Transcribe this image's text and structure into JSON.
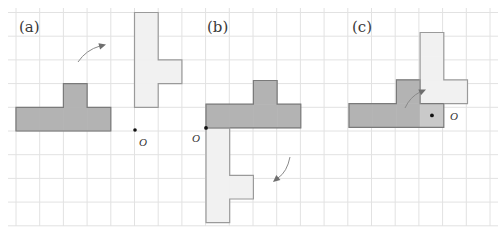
{
  "figure": {
    "grid": {
      "cell": 23.6,
      "x0": 16,
      "y0": 12.5,
      "cols_left": -1,
      "cols_right": 20,
      "rows_top": 0,
      "rows_bottom": 9,
      "line_color": "#e2e2e2"
    },
    "colors": {
      "original": "#b3b3b3",
      "original_stroke": "#7a7a7a",
      "rotated": "#f1f1f1",
      "rotated_stroke": "#9a9a9a",
      "overlap": "#c9c9c9",
      "arrow": "#8a8a8a",
      "point": "#111111"
    },
    "panels": [
      {
        "label": "(a)",
        "label_pos": [
          19,
          32
        ],
        "center_label": "O",
        "center": [
          135,
          130
        ],
        "center_label_pos": [
          139,
          145
        ],
        "original_cells": [
          [
            0,
            4
          ],
          [
            1,
            4
          ],
          [
            2,
            4
          ],
          [
            3,
            4
          ],
          [
            2,
            3
          ]
        ],
        "rotated_cells": [
          [
            5,
            0
          ],
          [
            5,
            1
          ],
          [
            5,
            2
          ],
          [
            5,
            3
          ],
          [
            6,
            2
          ]
        ],
        "arrow": {
          "path": "M79,62 Q88,50 103,46",
          "head": [
            105,
            45
          ],
          "dir": "right"
        }
      },
      {
        "label": "(b)",
        "label_pos": [
          207,
          32
        ],
        "center_label": "O",
        "center": [
          206,
          127
        ],
        "center_label_pos": [
          193,
          142
        ],
        "original_cells_px": {
          "x0": 206,
          "y0": 80.5
        },
        "original_cells": [
          [
            0,
            1
          ],
          [
            1,
            1
          ],
          [
            2,
            1
          ],
          [
            3,
            1
          ],
          [
            2,
            0
          ]
        ],
        "rotated_cells": [
          [
            0,
            2
          ],
          [
            0,
            3
          ],
          [
            0,
            4
          ],
          [
            0,
            5
          ],
          [
            1,
            4
          ]
        ],
        "arrow": {
          "path": "M290,157 Q286,174 275,181",
          "head": [
            273,
            182
          ],
          "dir": "down-left"
        }
      },
      {
        "label": "(c)",
        "label_pos": [
          352,
          32
        ],
        "center_label": "O",
        "center": [
          432,
          114
        ],
        "center_label_pos": [
          450,
          120
        ],
        "original_cells_px": {
          "x0": 349,
          "y0": 32.5
        },
        "original_cells": [
          [
            0,
            3
          ],
          [
            1,
            3
          ],
          [
            2,
            3
          ],
          [
            2,
            2
          ]
        ],
        "rotated_cells": [
          [
            3,
            0
          ],
          [
            3,
            1
          ],
          [
            3,
            2
          ],
          [
            4,
            2
          ]
        ],
        "overlap_cells": [
          [
            3,
            3
          ]
        ],
        "arrow": {
          "path": "M405,108 Q410,96 422,91",
          "head": [
            425,
            90
          ],
          "dir": "up-right"
        }
      }
    ]
  }
}
